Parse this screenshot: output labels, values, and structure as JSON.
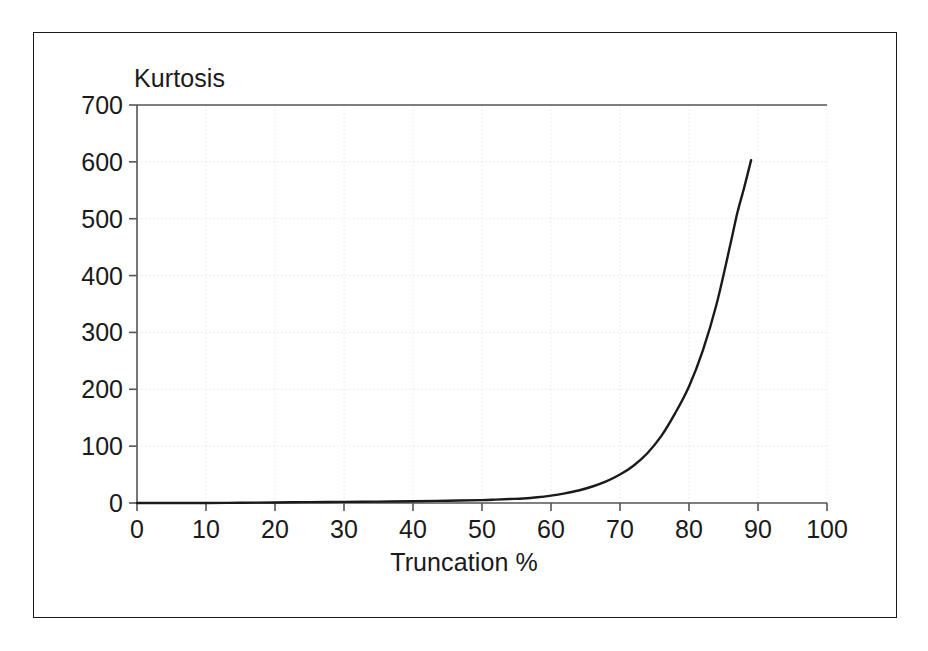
{
  "figure": {
    "background_color": "#ffffff",
    "frame_color": "#1a1a1a",
    "axis_color": "#555555",
    "curve_color": "#1a1a1a",
    "grid_color": "#e8e8e8"
  },
  "chart_data": {
    "type": "line",
    "title": "",
    "xlabel": "Truncation %",
    "ylabel": "Kurtosis",
    "xlim": [
      0,
      100
    ],
    "ylim": [
      0,
      700
    ],
    "grid": true,
    "legend": null,
    "x_ticks": [
      0,
      10,
      20,
      30,
      40,
      50,
      60,
      70,
      80,
      90,
      100
    ],
    "y_ticks": [
      0,
      100,
      200,
      300,
      400,
      500,
      600,
      700
    ],
    "x_tick_labels": [
      "0",
      "10",
      "20",
      "30",
      "40",
      "50",
      "60",
      "70",
      "80",
      "90",
      "100"
    ],
    "y_tick_labels": [
      "0",
      "100",
      "200",
      "300",
      "400",
      "500",
      "600",
      "700"
    ],
    "series": [
      {
        "name": "Kurtosis",
        "x": [
          0,
          5,
          10,
          15,
          20,
          25,
          30,
          35,
          40,
          45,
          50,
          52,
          54,
          56,
          58,
          60,
          62,
          64,
          66,
          68,
          70,
          72,
          74,
          76,
          78,
          80,
          82,
          84,
          86,
          87,
          88,
          89
        ],
        "values": [
          0,
          0,
          0,
          0.5,
          1,
          1.5,
          2,
          2.5,
          3,
          4,
          5,
          6,
          7,
          8,
          10,
          13,
          17,
          22,
          29,
          38,
          50,
          66,
          88,
          118,
          158,
          205,
          268,
          350,
          455,
          510,
          555,
          603
        ]
      }
    ],
    "annotations": []
  }
}
